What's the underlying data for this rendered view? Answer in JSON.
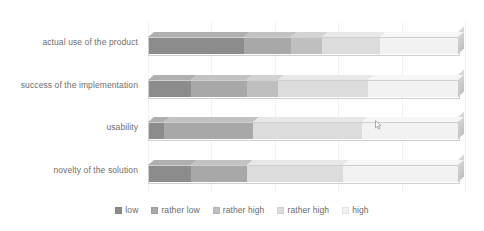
{
  "chart_data": {
    "type": "bar",
    "orientation": "horizontal",
    "stacked": true,
    "normalized": true,
    "style": "3d",
    "title": "",
    "subtitle": "",
    "xlabel": "",
    "ylabel": "",
    "grid": true,
    "xlim": [
      0,
      100
    ],
    "units": "percent",
    "legend_position": "bottom",
    "categories": [
      "actual use of the product",
      "success of the implementation",
      "usability",
      "novelty of the solution"
    ],
    "series": [
      {
        "name": "low",
        "color": "#8c8c8c",
        "values": [
          31,
          14,
          5,
          14
        ]
      },
      {
        "name": "rather low",
        "color": "#a8a8a8",
        "values": [
          15,
          18,
          29,
          18
        ]
      },
      {
        "name": "rather high",
        "color": "#bfbfbf",
        "values": [
          10,
          10,
          0,
          0
        ]
      },
      {
        "name": "rather high",
        "color": "#dcdcdc",
        "values": [
          19,
          29,
          35,
          31
        ]
      },
      {
        "name": "high",
        "color": "#f2f2f2",
        "values": [
          25,
          29,
          31,
          37
        ]
      }
    ],
    "legend": [
      {
        "label": "low",
        "color": "#8c8c8c"
      },
      {
        "label": "rather low",
        "color": "#a8a8a8"
      },
      {
        "label": "rather high",
        "color": "#bfbfbf"
      },
      {
        "label": "rather high",
        "color": "#dcdcdc"
      },
      {
        "label": "high",
        "color": "#f2f2f2"
      }
    ],
    "gridlines_percent": [
      0,
      20,
      40,
      60,
      80,
      100
    ],
    "background_color": "#ffffff",
    "label_color": "#6e6e6e"
  },
  "cursor": {
    "name": "mouse-pointer",
    "x_percent": 71.5,
    "bar_index": 2
  }
}
